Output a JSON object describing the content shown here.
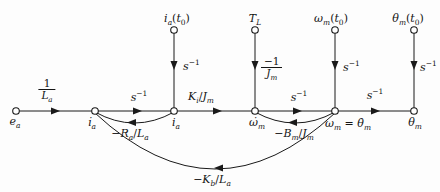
{
  "figure": {
    "kind": "signal-flow-graph",
    "background": "#fdfdfd",
    "ink": "#1a1a1a"
  },
  "nodes": {
    "main": [
      {
        "id": "e_a",
        "label": [
          {
            "t": "e"
          },
          {
            "t": "a",
            "sub": 1
          }
        ]
      },
      {
        "id": "i_a_dot",
        "label": [
          {
            "t": "i̇"
          },
          {
            "t": "a",
            "sub": 1
          }
        ]
      },
      {
        "id": "i_a",
        "label": [
          {
            "t": "i"
          },
          {
            "t": "a",
            "sub": 1
          }
        ]
      },
      {
        "id": "omega_m_dot",
        "label": [
          {
            "t": "ω̇"
          },
          {
            "t": "m",
            "sub": 1
          }
        ]
      },
      {
        "id": "omega_m_eq_theta_m_dot",
        "label": [
          {
            "t": "ω"
          },
          {
            "t": "m",
            "sub": 1
          },
          {
            "t": " = ",
            "up": 1
          },
          {
            "t": "θ̇"
          },
          {
            "t": "m",
            "sub": 1
          }
        ]
      },
      {
        "id": "theta_m",
        "label": [
          {
            "t": "θ"
          },
          {
            "t": "m",
            "sub": 1
          }
        ]
      }
    ],
    "initial": [
      {
        "id": "i_a_t0",
        "label": [
          {
            "t": "i"
          },
          {
            "t": "a",
            "sub": 1
          },
          {
            "t": "(",
            "up": 1
          },
          {
            "t": "t"
          },
          {
            "t": "0",
            "sub": 1,
            "up": 1
          },
          {
            "t": ")",
            "up": 1
          }
        ]
      },
      {
        "id": "T_L",
        "label": [
          {
            "t": "T"
          },
          {
            "t": "L",
            "sub": 1
          }
        ]
      },
      {
        "id": "omega_m_t0",
        "label": [
          {
            "t": "ω"
          },
          {
            "t": "m",
            "sub": 1
          },
          {
            "t": "(",
            "up": 1
          },
          {
            "t": "t"
          },
          {
            "t": "0",
            "sub": 1,
            "up": 1
          },
          {
            "t": ")",
            "up": 1
          }
        ]
      },
      {
        "id": "theta_m_t0",
        "label": [
          {
            "t": "θ"
          },
          {
            "t": "m",
            "sub": 1
          },
          {
            "t": "(",
            "up": 1
          },
          {
            "t": "t"
          },
          {
            "t": "0",
            "sub": 1,
            "up": 1
          },
          {
            "t": ")",
            "up": 1
          }
        ]
      }
    ]
  },
  "gains": {
    "one_over_La": {
      "num": [
        {
          "t": "1",
          "up": 1
        }
      ],
      "den": [
        {
          "t": "L"
        },
        {
          "t": "a",
          "sub": 1
        }
      ]
    },
    "s_inv": [
      {
        "t": "s"
      },
      {
        "t": "−1",
        "sup": 1,
        "up": 1
      }
    ],
    "Ki_over_Jm": [
      {
        "t": "K"
      },
      {
        "t": "i",
        "sub": 1
      },
      {
        "t": "/",
        "up": 1
      },
      {
        "t": "J"
      },
      {
        "t": "m",
        "sub": 1
      }
    ],
    "neg_one_over_Jm": {
      "num": [
        {
          "t": "−1",
          "up": 1
        }
      ],
      "den": [
        {
          "t": "J"
        },
        {
          "t": "m",
          "sub": 1
        }
      ]
    },
    "neg_Ra_over_La": [
      {
        "t": "−",
        "up": 1
      },
      {
        "t": "R"
      },
      {
        "t": "a",
        "sub": 1
      },
      {
        "t": "/",
        "up": 1
      },
      {
        "t": "L"
      },
      {
        "t": "a",
        "sub": 1
      }
    ],
    "neg_Bm_over_Jm": [
      {
        "t": "−",
        "up": 1
      },
      {
        "t": "B"
      },
      {
        "t": "m",
        "sub": 1
      },
      {
        "t": "/",
        "up": 1
      },
      {
        "t": "J"
      },
      {
        "t": "m",
        "sub": 1
      }
    ],
    "neg_Kb_over_La": [
      {
        "t": "−",
        "up": 1
      },
      {
        "t": "K"
      },
      {
        "t": "b",
        "sub": 1
      },
      {
        "t": "/",
        "up": 1
      },
      {
        "t": "L"
      },
      {
        "t": "a",
        "sub": 1
      }
    ]
  }
}
